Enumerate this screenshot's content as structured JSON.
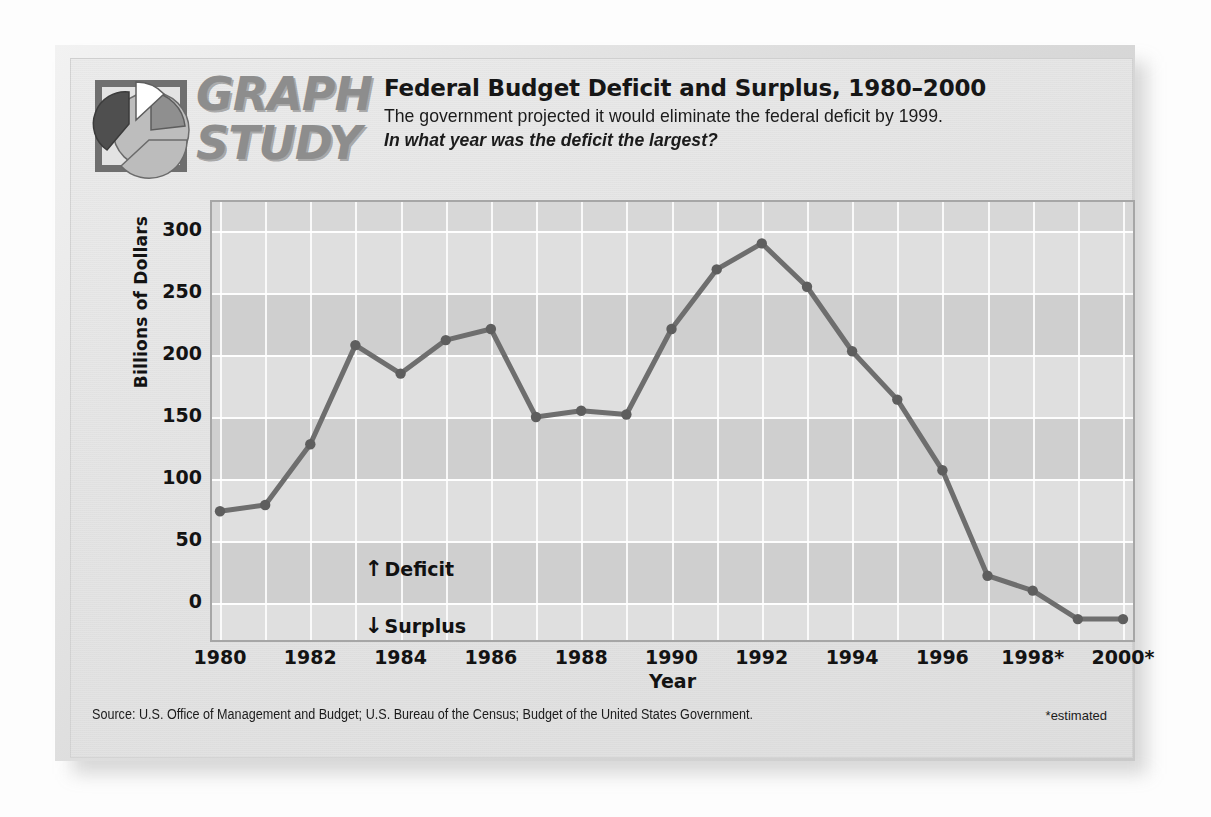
{
  "brand": {
    "line1": "GRAPH",
    "line2": "STUDY",
    "logo_icon": "pie-chart-icon"
  },
  "header": {
    "title": "Federal Budget Deficit and Surplus, 1980–2000",
    "subtitle": "The government projected it would eliminate the federal deficit by 1999.",
    "question": "In what year was the deficit the largest?"
  },
  "footer": {
    "source": "Source: U.S. Office of Management and Budget; U.S. Bureau of the Census; Budget of the United States Government.",
    "estimated_note": "*estimated"
  },
  "annotations": {
    "deficit": {
      "arrow": "↑",
      "label": "Deficit"
    },
    "surplus": {
      "arrow": "↓",
      "label": "Surplus"
    }
  },
  "colors": {
    "line": "#6e6e6e",
    "marker": "#5e5e5e",
    "plot_background": "#d7d7d7",
    "band_light": "#dfdfdf",
    "band_dark": "#cfcfcf",
    "gridline": "#ffffff",
    "frame": "#a6a6a6",
    "text": "#131313",
    "logo_dark": "#5a5a5a",
    "logo_mid": "#a8a8a8",
    "logo_light": "#ffffff"
  },
  "chart_data": {
    "type": "line",
    "title": "Federal Budget Deficit and Surplus, 1980–2000",
    "xlabel": "Year",
    "ylabel": "Billions of Dollars",
    "ylim": [
      -25,
      300
    ],
    "yticks": [
      300,
      250,
      200,
      150,
      100,
      50,
      0
    ],
    "ytick_labels": [
      "300",
      "250",
      "200",
      "150",
      "100",
      "50",
      "0"
    ],
    "xlim": [
      1980,
      2000
    ],
    "xticks": [
      1980,
      1982,
      1984,
      1986,
      1988,
      1990,
      1992,
      1994,
      1996,
      1998,
      2000
    ],
    "xtick_labels": [
      "1980",
      "1982",
      "1984",
      "1986",
      "1988",
      "1990",
      "1992",
      "1994",
      "1996",
      "1998*",
      "2000*"
    ],
    "grid": true,
    "legend": "none",
    "x": [
      1980,
      1981,
      1982,
      1983,
      1984,
      1985,
      1986,
      1987,
      1988,
      1989,
      1990,
      1991,
      1992,
      1993,
      1994,
      1995,
      1996,
      1997,
      1998,
      1999,
      2000
    ],
    "values": [
      74,
      79,
      128,
      208,
      185,
      212,
      221,
      150,
      155,
      152,
      221,
      269,
      290,
      255,
      203,
      164,
      107,
      22,
      10,
      -13,
      -13
    ],
    "series": [
      {
        "name": "Federal budget deficit (surplus)",
        "values": [
          74,
          79,
          128,
          208,
          185,
          212,
          221,
          150,
          155,
          152,
          221,
          269,
          290,
          255,
          203,
          164,
          107,
          22,
          10,
          -13,
          -13
        ]
      }
    ],
    "annotations": [
      "↑ Deficit",
      "↓ Surplus"
    ]
  }
}
